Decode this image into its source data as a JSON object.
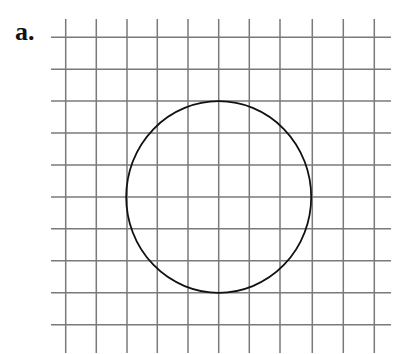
{
  "figure": {
    "label": "a.",
    "grid": {
      "vertical_lines_x": [
        65.7,
        96.3,
        127,
        157.3,
        188,
        218.7,
        249.3,
        280,
        312.3,
        343.3,
        374.3
      ],
      "vertical_top": 19,
      "vertical_bottom": 353,
      "horizontal_lines_y": [
        37.3,
        69.3,
        101,
        133,
        165,
        197,
        228.7,
        260.7,
        292.7,
        324.7
      ],
      "horizontal_left": 51,
      "horizontal_right": 391,
      "line_color": "#7a7a7a"
    },
    "circle": {
      "center_grid": [
        5,
        5
      ],
      "radius_grid_units": 3,
      "cx": 218.7,
      "cy": 197,
      "rx": 92.5,
      "ry": 95.8,
      "stroke": "#111111"
    }
  }
}
